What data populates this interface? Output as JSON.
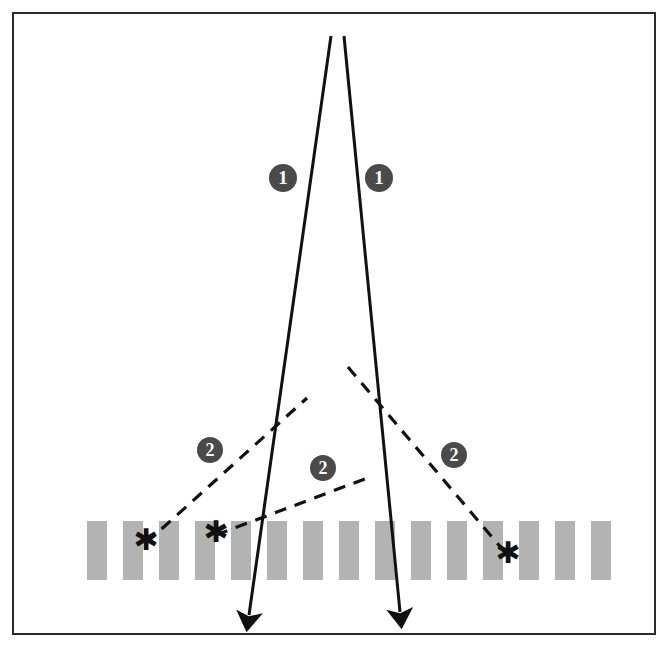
{
  "figure": {
    "background_color": "#ffffff",
    "border_color": "#2b2b2b",
    "bar_color": "#b3b3b3",
    "line_color": "#111111",
    "badge_fill": "#4a4a4a",
    "badge_text_color": "#ffffff"
  },
  "labels": {
    "primary_ray_left": "1",
    "primary_ray_right": "1",
    "secondary_ray_left": "2",
    "secondary_ray_middle": "2",
    "secondary_ray_right": "2"
  },
  "chart_data": {
    "type": "diagram",
    "xlabel": "",
    "ylabel": "",
    "frame": {
      "x": 12,
      "y": 12,
      "width": 644,
      "height": 623
    },
    "grating": {
      "count": 15,
      "bar_width": 20,
      "bar_height": 59,
      "pitch": 36,
      "first_bar_x": 87,
      "top_y": 521,
      "color": "#b3b3b3"
    },
    "solid_rays": [
      {
        "name": "primary-ray-left",
        "label": "1",
        "style": "solid",
        "arrow": true,
        "points": [
          [
            331,
            36
          ],
          [
            249,
            615
          ]
        ]
      },
      {
        "name": "primary-ray-right",
        "label": "1",
        "style": "solid",
        "arrow": true,
        "points": [
          [
            344,
            36
          ],
          [
            400,
            612
          ]
        ]
      }
    ],
    "dashed_rays": [
      {
        "name": "secondary-ray-left",
        "label": "2",
        "style": "dashed",
        "arrow": false,
        "points": [
          [
            146,
            543
          ],
          [
            307,
            398
          ]
        ]
      },
      {
        "name": "secondary-ray-middle",
        "label": "2",
        "style": "dashed",
        "arrow": false,
        "points": [
          [
            216,
            535
          ],
          [
            370,
            477
          ]
        ]
      },
      {
        "name": "secondary-ray-right",
        "label": "2",
        "style": "dashed",
        "arrow": false,
        "points": [
          [
            348,
            367
          ],
          [
            508,
            556
          ]
        ]
      }
    ],
    "markers": [
      {
        "name": "scatter-point-1",
        "symbol": "asterisk",
        "x": 146,
        "y": 543
      },
      {
        "name": "scatter-point-2",
        "symbol": "asterisk",
        "x": 216,
        "y": 535
      },
      {
        "name": "scatter-point-3",
        "symbol": "asterisk",
        "x": 508,
        "y": 556
      }
    ],
    "badges": [
      {
        "name": "badge-1-left",
        "text": "1",
        "cx": 283,
        "cy": 178
      },
      {
        "name": "badge-1-right",
        "text": "1",
        "cx": 379,
        "cy": 178
      },
      {
        "name": "badge-2-left",
        "text": "2",
        "cx": 210,
        "cy": 450
      },
      {
        "name": "badge-2-middle",
        "text": "2",
        "cx": 323,
        "cy": 468
      },
      {
        "name": "badge-2-right",
        "text": "2",
        "cx": 454,
        "cy": 455
      }
    ]
  }
}
